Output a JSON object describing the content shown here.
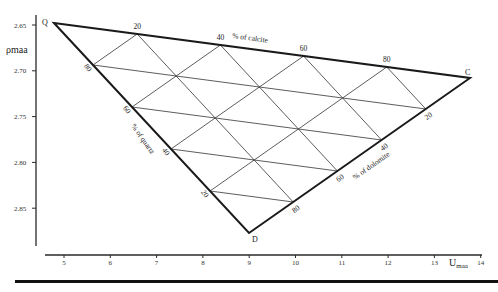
{
  "diagram": {
    "type": "ternary-crossplot",
    "y_axis": {
      "label": "ρmaa",
      "ticks": [
        "2.65",
        "2.70",
        "2.75",
        "2.80",
        "2.85"
      ],
      "tick_values": [
        2.65,
        2.7,
        2.75,
        2.8,
        2.85
      ]
    },
    "x_axis": {
      "label_main": "U",
      "label_sub": "maa",
      "ticks": [
        "5",
        "6",
        "7",
        "8",
        "9",
        "10",
        "11",
        "12",
        "13",
        "14"
      ],
      "tick_values": [
        5,
        6,
        7,
        8,
        9,
        10,
        11,
        12,
        13,
        14
      ]
    },
    "vertices": {
      "Q": {
        "label": "Q",
        "U": 4.8,
        "rho": 2.65
      },
      "C": {
        "label": "C",
        "U": 13.8,
        "rho": 2.71
      },
      "D": {
        "label": "D",
        "U": 9.0,
        "rho": 2.87
      }
    },
    "edges": {
      "calcite": {
        "title": "% of calcite",
        "ticks": [
          "20",
          "40",
          "60",
          "80"
        ]
      },
      "quartz": {
        "title": "% of quartz",
        "ticks": [
          "80",
          "60",
          "40",
          "20"
        ]
      },
      "dolomite": {
        "title": "% of dolomite",
        "ticks": [
          "80",
          "60",
          "40",
          "20"
        ]
      }
    },
    "grid_fractions": [
      0.2,
      0.4,
      0.6,
      0.8
    ],
    "colors": {
      "ink": "#1a1a1a",
      "grid": "#333333",
      "background": "#ffffff"
    }
  }
}
